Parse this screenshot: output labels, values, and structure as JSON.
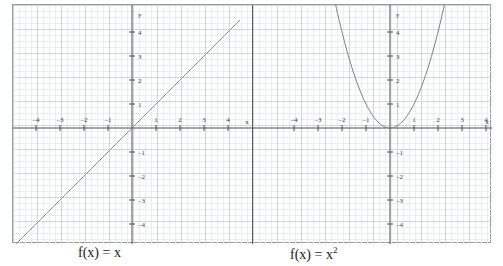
{
  "figure": {
    "background_color": "#ffffff",
    "frame_color": "#9a9a9a",
    "separator_color": "#5a5a5a",
    "curve_color": "#7d7d88",
    "axis_color": "#4d4d55",
    "grid_minor_color": "#e9eef3",
    "grid_major_color": "#ccd6e0"
  },
  "panels": [
    {
      "id": "left",
      "caption_text": "f(x) = x",
      "caption_base": "f(x) = x",
      "caption_exponent": "",
      "x_axis_label": "x",
      "y_axis_label": "y",
      "x_tick_labels": [
        "-4",
        "-3",
        "-2",
        "-1",
        "1",
        "2",
        "3",
        "4"
      ],
      "y_tick_labels": [
        "4",
        "3",
        "2",
        "1",
        "-1",
        "-2",
        "-3",
        "-4"
      ]
    },
    {
      "id": "right",
      "caption_text": "f(x) = x2",
      "caption_base": "f(x) = x",
      "caption_exponent": "2",
      "x_axis_label": "x",
      "y_axis_label": "y",
      "x_tick_labels": [
        "-4",
        "-3",
        "-2",
        "-1",
        "1",
        "2",
        "3",
        "4"
      ],
      "y_tick_labels": [
        "4",
        "3",
        "2",
        "1",
        "-1",
        "-2",
        "-3",
        "-4"
      ]
    }
  ],
  "chart_data": [
    {
      "type": "line",
      "title": "f(x) = x",
      "xlabel": "x",
      "ylabel": "y",
      "xlim": [
        -5.4,
        4.5
      ],
      "ylim": [
        -4.7,
        4.7
      ],
      "xticks": [
        -4,
        -3,
        -2,
        -1,
        1,
        2,
        3,
        4
      ],
      "yticks": [
        -4,
        -3,
        -2,
        -1,
        1,
        2,
        3,
        4
      ],
      "grid": true,
      "legend": "none",
      "series": [
        {
          "name": "f(x) = x",
          "equation": "y = x",
          "x": [
            -4.7,
            -4,
            -3,
            -2,
            -1,
            0,
            1,
            2,
            3,
            4,
            4.5
          ],
          "values": [
            -4.7,
            -4,
            -3,
            -2,
            -1,
            0,
            1,
            2,
            3,
            4,
            4.5
          ]
        }
      ]
    },
    {
      "type": "line",
      "title": "f(x) = x^2",
      "xlabel": "x",
      "ylabel": "y",
      "xlim": [
        -5.4,
        4.5
      ],
      "ylim": [
        -4.7,
        4.7
      ],
      "xticks": [
        -4,
        -3,
        -2,
        -1,
        1,
        2,
        3,
        4
      ],
      "yticks": [
        -4,
        -3,
        -2,
        -1,
        1,
        2,
        3,
        4
      ],
      "grid": true,
      "legend": "none",
      "series": [
        {
          "name": "f(x) = x^2",
          "equation": "y = x*x",
          "x": [
            -2.3,
            -2,
            -1.5,
            -1,
            -0.5,
            0,
            0.5,
            1,
            1.5,
            2,
            2.3
          ],
          "values": [
            5.29,
            4,
            2.25,
            1,
            0.25,
            0,
            0.25,
            1,
            2.25,
            4,
            5.29
          ]
        }
      ]
    }
  ]
}
